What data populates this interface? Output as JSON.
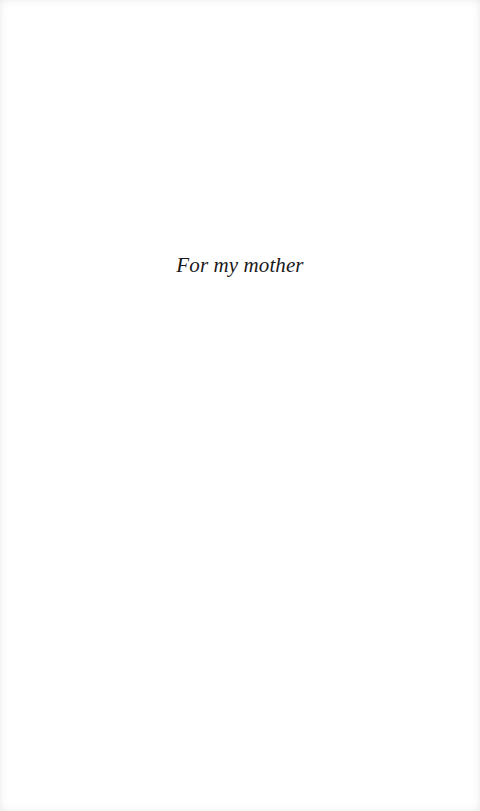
{
  "page": {
    "type": "dedication",
    "dedication_text": "For my mother"
  }
}
